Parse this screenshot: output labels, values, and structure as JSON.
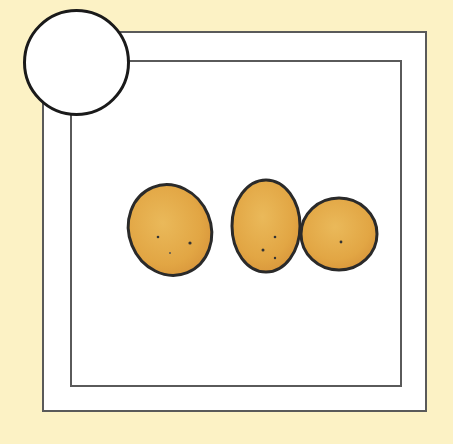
{
  "scene": {
    "background_color": "#fcf2c5",
    "frame_color": "#5a5a5a",
    "badge": {
      "shape": "circle",
      "text": ""
    },
    "illustration": {
      "subject": "three potatoes",
      "count": 3,
      "fill_color": "#e3aa48",
      "outline_color": "#2a2a2a"
    }
  }
}
